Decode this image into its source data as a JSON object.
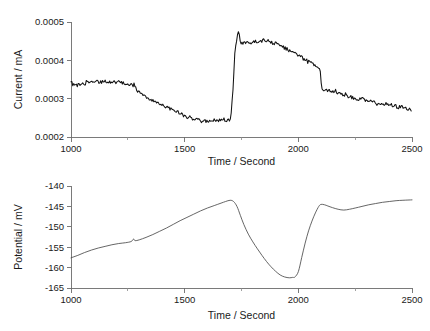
{
  "figure": {
    "background": "#ffffff",
    "trace_color_current": "#111111",
    "trace_color_potential": "#4a4a4a",
    "axis_color": "#6b6b6b"
  },
  "chart_data": [
    {
      "type": "line",
      "id": "current-vs-time",
      "title": "",
      "xlabel": "Time / Second",
      "ylabel": "Current / mA",
      "xlim": [
        1000,
        2500
      ],
      "ylim": [
        0.0002,
        0.0005
      ],
      "xticks": [
        1000,
        1500,
        2000,
        2500
      ],
      "xtick_labels": [
        "1000",
        "1500",
        "2000",
        "2500"
      ],
      "xticks_minor": [
        1250,
        1750,
        2250
      ],
      "yticks": [
        0.0002,
        0.0003,
        0.0004,
        0.0005
      ],
      "ytick_labels": [
        "0.0002",
        "0.0003",
        "0.0004",
        "0.0005"
      ],
      "grid": false,
      "legend": "none",
      "noise_amplitude": 4.5e-06,
      "annotations": [
        {
          "x": 1280,
          "label": "upward spike discontinuity"
        },
        {
          "x": 1710,
          "label": "sharp rise to peak"
        },
        {
          "x": 2100,
          "label": "downward spike discontinuity"
        }
      ],
      "x": [
        1000,
        1020,
        1040,
        1060,
        1080,
        1100,
        1120,
        1140,
        1160,
        1180,
        1200,
        1220,
        1240,
        1260,
        1275,
        1278,
        1282,
        1285,
        1300,
        1320,
        1340,
        1360,
        1380,
        1400,
        1420,
        1440,
        1460,
        1480,
        1500,
        1520,
        1540,
        1560,
        1580,
        1600,
        1620,
        1640,
        1660,
        1680,
        1695,
        1700,
        1705,
        1710,
        1715,
        1720,
        1725,
        1730,
        1735,
        1740,
        1745,
        1750,
        1760,
        1770,
        1780,
        1800,
        1820,
        1840,
        1860,
        1880,
        1900,
        1920,
        1940,
        1960,
        1980,
        2000,
        2020,
        2040,
        2060,
        2080,
        2095,
        2098,
        2102,
        2106,
        2120,
        2140,
        2160,
        2180,
        2200,
        2220,
        2240,
        2260,
        2280,
        2300,
        2320,
        2340,
        2360,
        2380,
        2400,
        2420,
        2440,
        2460,
        2480,
        2500
      ],
      "y": [
        0.000341,
        0.000335,
        0.000339,
        0.000341,
        0.000343,
        0.000344,
        0.000345,
        0.000345,
        0.000344,
        0.000344,
        0.000343,
        0.000342,
        0.00034,
        0.000337,
        0.000334,
        0.000347,
        0.00033,
        0.000326,
        0.000318,
        0.00031,
        0.000303,
        0.000296,
        0.00029,
        0.000284,
        0.000278,
        0.000272,
        0.000266,
        0.000261,
        0.000256,
        0.000251,
        0.000247,
        0.000244,
        0.000241,
        0.000241,
        0.000242,
        0.000243,
        0.000244,
        0.000244,
        0.000243,
        0.000248,
        0.000268,
        0.0003,
        0.000355,
        0.00041,
        0.00044,
        0.000462,
        0.00048,
        0.00047,
        0.00045,
        0.000442,
        0.000444,
        0.000446,
        0.000447,
        0.000449,
        0.00045,
        0.000451,
        0.00045,
        0.000448,
        0.000444,
        0.000439,
        0.000433,
        0.000426,
        0.000419,
        0.000412,
        0.000405,
        0.000398,
        0.000391,
        0.000385,
        0.000381,
        0.000368,
        0.000322,
        0.000324,
        0.000322,
        0.00032,
        0.00032,
        0.000316,
        0.000311,
        0.000307,
        0.000303,
        0.0003,
        0.000298,
        0.000295,
        0.000292,
        0.000289,
        0.000287,
        0.000285,
        0.000283,
        0.000281,
        0.000279,
        0.000277,
        0.000274,
        0.000271
      ]
    },
    {
      "type": "line",
      "id": "potential-vs-time",
      "title": "",
      "xlabel": "Time / Second",
      "ylabel": "Potential / mV",
      "xlim": [
        1000,
        2500
      ],
      "ylim": [
        -165,
        -140
      ],
      "xticks": [
        1000,
        1500,
        2000,
        2500
      ],
      "xtick_labels": [
        "1000",
        "1500",
        "2000",
        "2500"
      ],
      "xticks_minor": [
        1250,
        1750,
        2250
      ],
      "yticks": [
        -165,
        -160,
        -155,
        -150,
        -145,
        -140
      ],
      "ytick_labels": [
        "-165",
        "-160",
        "-155",
        "-150",
        "-145",
        "-140"
      ],
      "grid": false,
      "legend": "none",
      "annotations": [
        {
          "x": 1280,
          "label": "small kink"
        },
        {
          "x": 1700,
          "label": "maximum before drop"
        },
        {
          "x": 1930,
          "label": "minimum"
        }
      ],
      "x": [
        1000,
        1030,
        1060,
        1090,
        1120,
        1150,
        1180,
        1210,
        1240,
        1265,
        1275,
        1282,
        1300,
        1330,
        1360,
        1390,
        1420,
        1450,
        1480,
        1510,
        1540,
        1570,
        1600,
        1630,
        1660,
        1680,
        1700,
        1715,
        1730,
        1745,
        1760,
        1780,
        1800,
        1820,
        1840,
        1860,
        1880,
        1900,
        1920,
        1940,
        1960,
        1975,
        1985,
        2000,
        2015,
        2030,
        2045,
        2060,
        2075,
        2090,
        2100,
        2115,
        2130,
        2150,
        2175,
        2200,
        2225,
        2250,
        2280,
        2310,
        2340,
        2370,
        2400,
        2430,
        2460,
        2500
      ],
      "y": [
        -157.6,
        -157.0,
        -156.3,
        -155.7,
        -155.2,
        -154.8,
        -154.4,
        -154.1,
        -153.9,
        -153.6,
        -153.0,
        -153.4,
        -153.2,
        -152.6,
        -151.9,
        -151.1,
        -150.3,
        -149.4,
        -148.5,
        -147.7,
        -146.9,
        -146.1,
        -145.4,
        -144.8,
        -144.2,
        -143.8,
        -143.5,
        -143.8,
        -145.0,
        -147.2,
        -149.4,
        -151.8,
        -153.7,
        -155.4,
        -157.0,
        -158.5,
        -159.8,
        -160.9,
        -161.8,
        -162.3,
        -162.5,
        -162.4,
        -162.3,
        -161.0,
        -157.5,
        -154.0,
        -151.0,
        -148.6,
        -146.6,
        -145.0,
        -144.5,
        -144.6,
        -144.9,
        -145.3,
        -145.7,
        -145.9,
        -145.7,
        -145.4,
        -145.0,
        -144.6,
        -144.3,
        -144.0,
        -143.8,
        -143.6,
        -143.5,
        -143.4
      ]
    }
  ]
}
